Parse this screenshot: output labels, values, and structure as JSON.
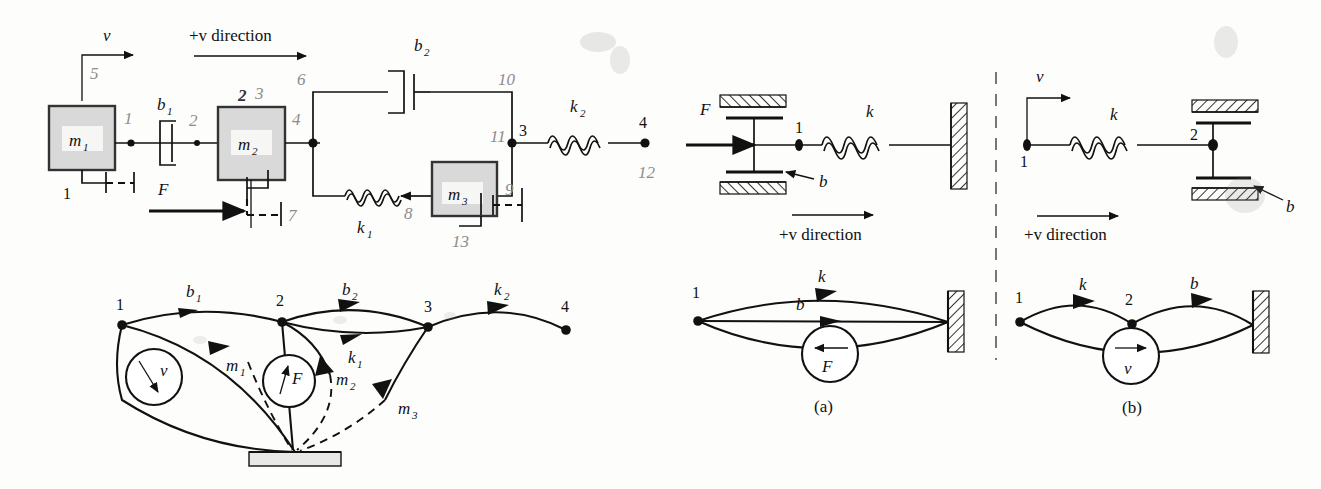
{
  "figure": {
    "title_text": "",
    "panels": [
      "top-left-mechanical-system",
      "bottom-left-linear-graph",
      "panel-a-mechanical",
      "panel-b-mechanical",
      "panel-a-graph",
      "panel-b-graph"
    ]
  },
  "top_left": {
    "direction_label": "+v direction",
    "velocity_label": "v",
    "mass1": "m",
    "mass1_sub": "1",
    "mass2": "m",
    "mass2_sub": "2",
    "mass3": "m",
    "mass3_sub": "3",
    "damper1": "b",
    "damper1_sub": "1",
    "damper2": "b",
    "damper2_sub": "2",
    "spring1": "k",
    "spring1_sub": "1",
    "spring2": "k",
    "spring2_sub": "2",
    "force": "F",
    "ground_label": "1",
    "node3": "3",
    "node4": "4",
    "pencil_annotations": [
      "5",
      "1",
      "2",
      "2",
      "3",
      "4",
      "6",
      "10",
      "11",
      "9",
      "7",
      "8",
      "12",
      "13"
    ]
  },
  "bottom_left_graph": {
    "nodes": [
      "1",
      "2",
      "3",
      "4"
    ],
    "edges": [
      {
        "label": "b",
        "sub": "1",
        "from": "1",
        "to": "2"
      },
      {
        "label": "m",
        "sub": "1",
        "from": "1",
        "to": "ground"
      },
      {
        "label": "b",
        "sub": "2",
        "from": "2",
        "to": "3"
      },
      {
        "label": "k",
        "sub": "1",
        "from": "2",
        "to": "3"
      },
      {
        "label": "m",
        "sub": "2",
        "from": "2",
        "to": "ground"
      },
      {
        "label": "m",
        "sub": "3",
        "from": "3",
        "to": "ground"
      },
      {
        "label": "k",
        "sub": "2",
        "from": "3",
        "to": "4"
      }
    ],
    "sources": [
      {
        "label": "v",
        "type": "velocity-source",
        "at": "1"
      },
      {
        "label": "F",
        "type": "force-source",
        "at": "2"
      }
    ]
  },
  "panel_a": {
    "caption": "(a)",
    "force": "F",
    "spring": "k",
    "damper": "b",
    "node1": "1",
    "direction_label": "+v direction",
    "graph": {
      "node1": "1",
      "edges": [
        {
          "label": "k"
        },
        {
          "label": "b"
        }
      ],
      "source": {
        "label": "F",
        "type": "force-source"
      }
    }
  },
  "panel_b": {
    "caption": "(b)",
    "velocity": "v",
    "spring": "k",
    "damper": "b",
    "node1": "1",
    "node2": "2",
    "direction_label": "+v direction",
    "graph": {
      "node1": "1",
      "node2": "2",
      "edges": [
        {
          "label": "k"
        },
        {
          "label": "b"
        }
      ],
      "source": {
        "label": "v",
        "type": "velocity-source"
      }
    }
  },
  "colors": {
    "ink": "#111111",
    "pencil": "#8d8d8d",
    "mass_fill": "#d9d9d9",
    "paper": "#fdfdfb"
  }
}
